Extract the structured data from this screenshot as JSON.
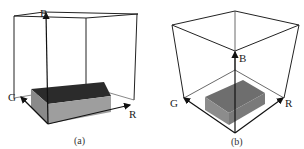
{
  "figure": {
    "panels": [
      {
        "caption": "(a)",
        "axes": {
          "r": "R",
          "g": "G",
          "b": "B"
        },
        "box_top_color": "#2b2b2b",
        "box_side_color": "#9a9a9a"
      },
      {
        "caption": "(b)",
        "axes": {
          "r": "R",
          "g": "G",
          "b": "B"
        },
        "box_top_color": "#6e6e6e",
        "box_side_color": "#8c8c8c"
      }
    ],
    "line_color": "#222222"
  }
}
